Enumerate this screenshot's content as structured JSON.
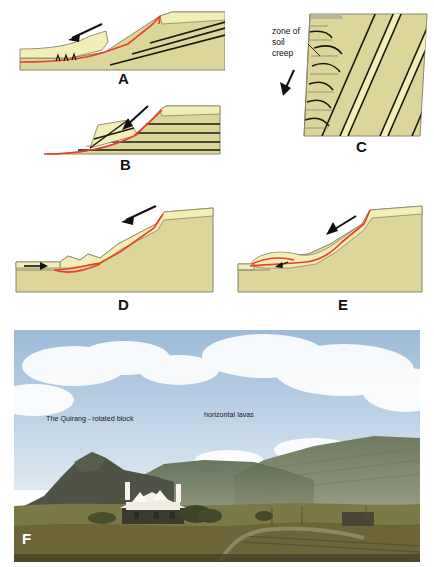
{
  "figure": {
    "background": "#ffffff"
  },
  "colors": {
    "upper_bed_light": "#f2eeb8",
    "rock_khaki": "#ddd69a",
    "rock_khaki_dark": "#d2cb8e",
    "bedding_line": "#1a1a10",
    "outline": "#8a8668",
    "slip_surface_red": "#e8412a",
    "arrow_black": "#111111",
    "panel_letter": "#111111",
    "sky_blue": "#b9cfe4",
    "mountain_green": "#6e7a5e",
    "grass_fore": "#7d7340"
  },
  "panels": [
    {
      "id": "A",
      "letter": "A",
      "name": "translational-slide",
      "movement_arrow": "down-slope-left",
      "has_slip_surface": true,
      "has_toe_thrusts": true
    },
    {
      "id": "B",
      "letter": "B",
      "name": "rotational-slump-blocks",
      "movement_arrow": "down-slope-left",
      "has_slip_surface": true,
      "has_toe_thrusts": false
    },
    {
      "id": "C",
      "letter": "C",
      "name": "soil-creep",
      "label": "zone of\nsoil\ncreep",
      "label_lines": [
        "zone of",
        "soil",
        "creep"
      ],
      "movement_arrow": "down-slope-left",
      "has_slip_surface": false,
      "has_toe_thrusts": false
    },
    {
      "id": "D",
      "letter": "D",
      "name": "debris-flow-with-lobate-toe",
      "movement_arrow": "down-slope-left",
      "toe_arrow": "right",
      "has_slip_surface": true,
      "has_toe_thrusts": false
    },
    {
      "id": "E",
      "letter": "E",
      "name": "flow-slide-overriding-toe",
      "movement_arrow": "down-slope-left",
      "has_slip_surface": true,
      "has_toe_thrusts": false
    }
  ],
  "photo": {
    "letter": "F",
    "name": "quirang-field-photograph",
    "labels": [
      {
        "text": "The Quirang - rotated block",
        "name": "quirang-rotated-block-label"
      },
      {
        "text": "horizontal lavas",
        "name": "horizontal-lavas-label"
      }
    ]
  }
}
